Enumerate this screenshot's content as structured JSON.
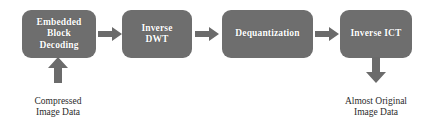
{
  "diagram": {
    "background_color": "#ffffff",
    "box_fill_color": "#6e6e6e",
    "box_text_color": "#ffffff",
    "arrow_color": "#6b6b6b",
    "caption_text_color": "#2b2b2b",
    "stages": [
      {
        "id": "embedded-block-decoding",
        "label": "Embedded\nBlock\nDecoding"
      },
      {
        "id": "inverse-dwt",
        "label": "Inverse\nDWT"
      },
      {
        "id": "dequantization",
        "label": "Dequantization"
      },
      {
        "id": "inverse-ict",
        "label": "Inverse ICT"
      }
    ],
    "connectors": [
      {
        "id": "arrow-1",
        "from": "embedded-block-decoding",
        "to": "inverse-dwt",
        "direction": "right"
      },
      {
        "id": "arrow-2",
        "from": "inverse-dwt",
        "to": "dequantization",
        "direction": "right"
      },
      {
        "id": "arrow-3",
        "from": "dequantization",
        "to": "inverse-ict",
        "direction": "right"
      },
      {
        "id": "arrow-input",
        "to": "embedded-block-decoding",
        "direction": "up"
      },
      {
        "id": "arrow-output",
        "from": "inverse-ict",
        "direction": "down"
      }
    ],
    "captions": [
      {
        "id": "input-caption",
        "label": "Compressed\nImage Data"
      },
      {
        "id": "output-caption",
        "label": "Almost Original\nImage Data"
      }
    ]
  }
}
